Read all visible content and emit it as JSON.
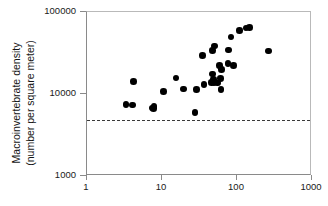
{
  "chart_data": {
    "type": "scatter",
    "title": "",
    "xlabel": "",
    "ylabel": "Macroinvertebrate density (number per square meter)",
    "ylabel_lines": [
      "Macroinvertebrate density",
      "(number per square meter)"
    ],
    "xscale": "log",
    "yscale": "log",
    "xlim": [
      1,
      1000
    ],
    "ylim": [
      1000,
      100000
    ],
    "xticks": [
      1,
      10,
      100,
      1000
    ],
    "xtick_labels": [
      "1",
      "10",
      "100",
      "1000"
    ],
    "yticks": [
      1000,
      10000,
      100000
    ],
    "ytick_labels": [
      "1000",
      "10000",
      "100000"
    ],
    "grid": false,
    "legend": null,
    "marker": {
      "shape": "circle",
      "color": "#000000",
      "size_px": 6.6
    },
    "annotations": [
      {
        "type": "hline",
        "label": "threshold",
        "y": 4700,
        "style": "dashed",
        "color": "#3a3a3a"
      }
    ],
    "points": [
      {
        "x": 3.4,
        "y": 7200
      },
      {
        "x": 4.2,
        "y": 7100
      },
      {
        "x": 4.3,
        "y": 13800
      },
      {
        "x": 7.6,
        "y": 6600
      },
      {
        "x": 8.0,
        "y": 6500
      },
      {
        "x": 8.1,
        "y": 6800
      },
      {
        "x": 10.8,
        "y": 10500
      },
      {
        "x": 15.8,
        "y": 15200
      },
      {
        "x": 19.8,
        "y": 11200
      },
      {
        "x": 28.5,
        "y": 5800
      },
      {
        "x": 29.5,
        "y": 11000
      },
      {
        "x": 36.0,
        "y": 28500
      },
      {
        "x": 37.5,
        "y": 12700
      },
      {
        "x": 47.0,
        "y": 13500
      },
      {
        "x": 48.5,
        "y": 17000
      },
      {
        "x": 49.0,
        "y": 33000
      },
      {
        "x": 50.5,
        "y": 14500
      },
      {
        "x": 51.0,
        "y": 13400
      },
      {
        "x": 52.0,
        "y": 37500
      },
      {
        "x": 57.0,
        "y": 13200
      },
      {
        "x": 60.0,
        "y": 21500
      },
      {
        "x": 62.0,
        "y": 15000
      },
      {
        "x": 63.0,
        "y": 11000
      },
      {
        "x": 64.0,
        "y": 19500
      },
      {
        "x": 78.0,
        "y": 23000
      },
      {
        "x": 80.0,
        "y": 33500
      },
      {
        "x": 86.0,
        "y": 48000
      },
      {
        "x": 92.0,
        "y": 21800
      },
      {
        "x": 112.0,
        "y": 58000
      },
      {
        "x": 136.0,
        "y": 62000
      },
      {
        "x": 152.0,
        "y": 62500
      },
      {
        "x": 270.0,
        "y": 32500
      }
    ]
  }
}
